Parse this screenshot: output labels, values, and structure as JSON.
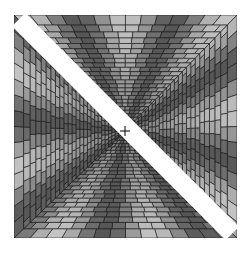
{
  "figure": {
    "canvas": {
      "width": 251,
      "height": 261,
      "background": "#ffffff"
    },
    "square": {
      "x": 14,
      "y": 15,
      "size": 223
    },
    "center": {
      "x": 125,
      "y": 131
    },
    "band": {
      "color": "#ffffff",
      "half_width": 9.5
    },
    "crosshair": {
      "size": 5,
      "color": "#000000",
      "stroke": 1
    },
    "grid": {
      "cells": 28,
      "line_color": "#1a1a1a",
      "gray_min": 40,
      "gray_max": 225
    }
  }
}
